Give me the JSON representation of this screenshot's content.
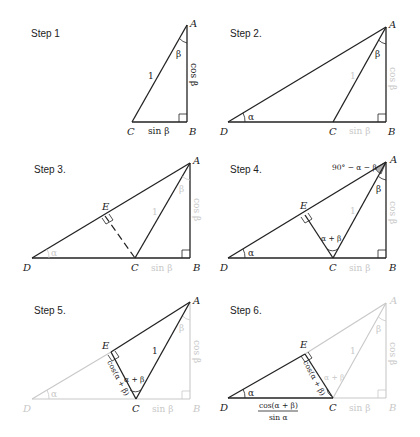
{
  "figure": {
    "colors": {
      "ink": "#222222",
      "faded": "#c8c8c8",
      "shade": "#b0b0b0"
    }
  },
  "steps": [
    {
      "label": "Step 1",
      "points": {
        "A": "A",
        "B": "B",
        "C": "C"
      },
      "labels": {
        "hyp": "1",
        "vertical": "cos β",
        "base": "sin β",
        "angle_A": "β"
      }
    },
    {
      "label": "Step 2.",
      "points": {
        "A": "A",
        "B": "B",
        "C": "C",
        "D": "D"
      },
      "labels": {
        "hyp": "1",
        "vertical": "cos β",
        "base": "sin β",
        "angle_A": "β",
        "angle_D": "α"
      }
    },
    {
      "label": "Step 3.",
      "points": {
        "A": "A",
        "B": "B",
        "C": "C",
        "D": "D",
        "E": "E"
      },
      "labels": {
        "hyp": "1",
        "vertical": "cos β",
        "base": "sin β",
        "angle_A": "β",
        "angle_D": "α"
      }
    },
    {
      "label": "Step 4.",
      "points": {
        "A": "A",
        "B": "B",
        "C": "C",
        "D": "D",
        "E": "E"
      },
      "labels": {
        "hyp": "1",
        "vertical": "cos β",
        "base": "sin β",
        "angle_A": "β",
        "angle_D": "α",
        "angle_C": "α + β",
        "angle_EAC": "90° − α − β"
      }
    },
    {
      "label": "Step 5.",
      "points": {
        "A": "A",
        "B": "B",
        "C": "C",
        "D": "D",
        "E": "E"
      },
      "labels": {
        "hyp": "1",
        "vertical": "cos β",
        "base": "sin β",
        "angle_A": "β",
        "angle_D": "α",
        "angle_C": "α + β",
        "EC": "cos(α + β)"
      }
    },
    {
      "label": "Step 6.",
      "points": {
        "A": "A",
        "B": "B",
        "C": "C",
        "D": "D",
        "E": "E"
      },
      "labels": {
        "hyp": "1",
        "vertical": "cos β",
        "base": "sin β",
        "angle_A": "β",
        "angle_D": "α",
        "angle_C": "α + β",
        "EC": "cos(α + β)",
        "DC_num": "cos(α + β)",
        "DC_den": "sin α"
      }
    }
  ]
}
